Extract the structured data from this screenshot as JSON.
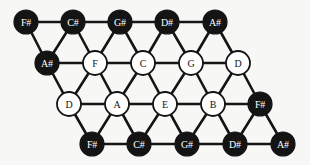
{
  "figure": {
    "name": "tonnetz-lattice",
    "background_color": "#f7f7f5",
    "node_fill_black": "#141414",
    "node_fill_white": "#ffffff",
    "edge_color": "#151515",
    "node_radius": 12,
    "rows": 4,
    "columns": 5
  },
  "nodes": [
    {
      "id": "n0",
      "label": "F#",
      "style": "black",
      "row": 0,
      "col": 0,
      "x": 26,
      "y": 22
    },
    {
      "id": "n1",
      "label": "C#",
      "style": "black",
      "row": 0,
      "col": 1,
      "x": 73,
      "y": 22
    },
    {
      "id": "n2",
      "label": "G#",
      "style": "black",
      "row": 0,
      "col": 2,
      "x": 120,
      "y": 22
    },
    {
      "id": "n3",
      "label": "D#",
      "style": "black",
      "row": 0,
      "col": 3,
      "x": 167,
      "y": 22
    },
    {
      "id": "n4",
      "label": "A#",
      "style": "black",
      "row": 0,
      "col": 4,
      "x": 215,
      "y": 22
    },
    {
      "id": "n5",
      "label": "A#",
      "style": "black",
      "row": 1,
      "col": 0,
      "x": 47,
      "y": 63
    },
    {
      "id": "n6",
      "label": "F",
      "style": "white",
      "row": 1,
      "col": 1,
      "x": 95,
      "y": 63
    },
    {
      "id": "n7",
      "label": "C",
      "style": "white",
      "row": 1,
      "col": 2,
      "x": 143,
      "y": 63
    },
    {
      "id": "n8",
      "label": "G",
      "style": "white",
      "row": 1,
      "col": 3,
      "x": 191,
      "y": 63
    },
    {
      "id": "n9",
      "label": "D",
      "style": "white",
      "row": 1,
      "col": 4,
      "x": 238,
      "y": 63
    },
    {
      "id": "n10",
      "label": "D",
      "style": "white",
      "row": 2,
      "col": 0,
      "x": 69,
      "y": 104
    },
    {
      "id": "n11",
      "label": "A",
      "style": "white",
      "row": 2,
      "col": 1,
      "x": 117,
      "y": 104
    },
    {
      "id": "n12",
      "label": "E",
      "style": "white",
      "row": 2,
      "col": 2,
      "x": 165,
      "y": 104
    },
    {
      "id": "n13",
      "label": "B",
      "style": "white",
      "row": 2,
      "col": 3,
      "x": 213,
      "y": 104
    },
    {
      "id": "n14",
      "label": "F#",
      "style": "black",
      "row": 2,
      "col": 4,
      "x": 260,
      "y": 104
    },
    {
      "id": "n15",
      "label": "F#",
      "style": "black",
      "row": 3,
      "col": 0,
      "x": 92,
      "y": 144
    },
    {
      "id": "n16",
      "label": "C#",
      "style": "black",
      "row": 3,
      "col": 1,
      "x": 139,
      "y": 144
    },
    {
      "id": "n17",
      "label": "G#",
      "style": "black",
      "row": 3,
      "col": 2,
      "x": 187,
      "y": 144
    },
    {
      "id": "n18",
      "label": "D#",
      "style": "black",
      "row": 3,
      "col": 3,
      "x": 235,
      "y": 144
    },
    {
      "id": "n19",
      "label": "A#",
      "style": "black",
      "row": 3,
      "col": 4,
      "x": 283,
      "y": 144
    }
  ],
  "edges": [
    [
      "n0",
      "n1"
    ],
    [
      "n1",
      "n2"
    ],
    [
      "n2",
      "n3"
    ],
    [
      "n3",
      "n4"
    ],
    [
      "n5",
      "n6"
    ],
    [
      "n6",
      "n7"
    ],
    [
      "n7",
      "n8"
    ],
    [
      "n8",
      "n9"
    ],
    [
      "n10",
      "n11"
    ],
    [
      "n11",
      "n12"
    ],
    [
      "n12",
      "n13"
    ],
    [
      "n13",
      "n14"
    ],
    [
      "n15",
      "n16"
    ],
    [
      "n16",
      "n17"
    ],
    [
      "n17",
      "n18"
    ],
    [
      "n18",
      "n19"
    ],
    [
      "n0",
      "n5"
    ],
    [
      "n1",
      "n6"
    ],
    [
      "n2",
      "n7"
    ],
    [
      "n3",
      "n8"
    ],
    [
      "n4",
      "n9"
    ],
    [
      "n1",
      "n5"
    ],
    [
      "n2",
      "n6"
    ],
    [
      "n3",
      "n7"
    ],
    [
      "n4",
      "n8"
    ],
    [
      "n5",
      "n10"
    ],
    [
      "n6",
      "n11"
    ],
    [
      "n7",
      "n12"
    ],
    [
      "n8",
      "n13"
    ],
    [
      "n9",
      "n14"
    ],
    [
      "n6",
      "n10"
    ],
    [
      "n7",
      "n11"
    ],
    [
      "n8",
      "n12"
    ],
    [
      "n9",
      "n13"
    ],
    [
      "n10",
      "n15"
    ],
    [
      "n11",
      "n16"
    ],
    [
      "n12",
      "n17"
    ],
    [
      "n13",
      "n18"
    ],
    [
      "n14",
      "n19"
    ],
    [
      "n11",
      "n15"
    ],
    [
      "n12",
      "n16"
    ],
    [
      "n13",
      "n17"
    ],
    [
      "n14",
      "n18"
    ]
  ]
}
